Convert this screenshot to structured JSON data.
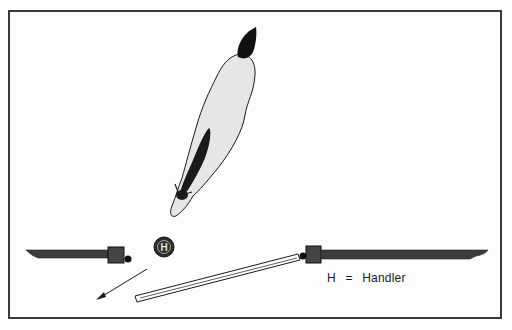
{
  "diagram": {
    "type": "handling-layout",
    "elements": {
      "horse": {
        "orientation": "head pointing down-left",
        "label": ""
      },
      "handler": {
        "symbol": "H"
      },
      "left_gate": {
        "label": ""
      },
      "right_gate": {
        "label": ""
      },
      "swinging_gate": {
        "label": ""
      },
      "arrow": {
        "direction": "down-left"
      }
    },
    "legend": {
      "symbol": "H",
      "equals": "=",
      "meaning": "Handler"
    },
    "colors": {
      "frame": "#3a3a3a",
      "horse_body": "#e8e8e8",
      "dark": "#2a2a2a",
      "rail": "#3c3c3c"
    }
  }
}
